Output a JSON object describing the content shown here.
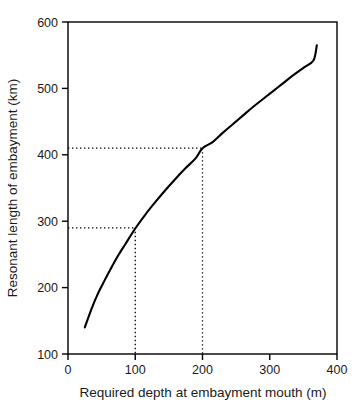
{
  "chart_data": {
    "type": "line",
    "title": "",
    "xlabel": "Required depth at embayment mouth (m)",
    "ylabel": "Resonant length of embayment (km)",
    "xlim": [
      0,
      400
    ],
    "ylim": [
      100,
      600
    ],
    "xticks": [
      0,
      100,
      200,
      300,
      400
    ],
    "yticks": [
      100,
      200,
      300,
      400,
      500,
      600
    ],
    "xtick_labels": [
      "0",
      "100",
      "200",
      "300",
      "400"
    ],
    "ytick_labels": [
      "100",
      "200",
      "300",
      "400",
      "500",
      "600"
    ],
    "grid": false,
    "legend": false,
    "legend_position": "none",
    "series": [
      {
        "name": "Resonant length vs required depth",
        "x": [
          25,
          35,
          45,
          55,
          65,
          75,
          85,
          100,
          115,
          130,
          145,
          160,
          175,
          190,
          200,
          215,
          230,
          245,
          260,
          275,
          290,
          305,
          320,
          335,
          350,
          365,
          370
        ],
        "y": [
          140,
          168,
          192,
          212,
          231,
          249,
          265,
          289,
          310,
          329,
          347,
          364,
          380,
          395,
          410,
          419,
          433,
          446,
          459,
          472,
          484,
          496,
          508,
          520,
          531,
          542,
          565
        ]
      }
    ],
    "annotations": [
      {
        "name": "guide-100m",
        "type": "dotted-guide",
        "x": 100,
        "y": 290,
        "note": "Depth 100 m maps to resonant length about 290 km"
      },
      {
        "name": "guide-200m",
        "type": "dotted-guide",
        "x": 200,
        "y": 410,
        "note": "Depth 200 m maps to resonant length about 410 km"
      }
    ],
    "curve_endpoints": {
      "start": {
        "x": 25,
        "y": 140
      },
      "end": {
        "x": 370,
        "y": 565
      }
    },
    "colors": {
      "curve": "#000000",
      "axis": "#000000",
      "guide": "#000000",
      "background": "#ffffff"
    }
  }
}
